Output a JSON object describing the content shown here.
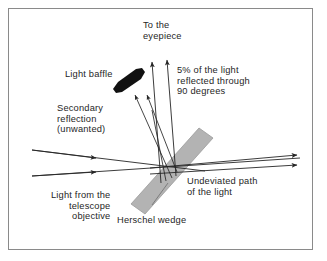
{
  "figure": {
    "kind": "optics-ray-diagram",
    "subject": "Herschel wedge",
    "background_color": "#ffffff",
    "frame_color": "#8a8a8a",
    "ink_color": "#262626",
    "wedge_fill_color": "#b3b3b3",
    "wedge_stroke_color": "#8f8f8f",
    "baffle_color": "#111111"
  },
  "labels": {
    "to_eyepiece": {
      "line1": "To the",
      "line2": "eyepiece"
    },
    "five_percent": {
      "line1": "5% of the light",
      "line2": "reflected through",
      "line3": "90 degrees"
    },
    "light_baffle": "Light baffle",
    "secondary_reflection": {
      "line1": "Secondary",
      "line2": "reflection",
      "line3": "(unwanted)"
    },
    "light_from_objective": {
      "line1": "Light from the",
      "line2": "telescope",
      "line3": "objective"
    },
    "herschel_wedge": "Herschel wedge",
    "undeviated_path": {
      "line1": "Undeviated path",
      "line2": "of the light"
    }
  },
  "elements": {
    "baffle_name": "light-baffle-shape",
    "wedge_name": "herschel-wedge-prism",
    "incoming_rays_name": "incoming-light-rays",
    "transmitted_rays_name": "transmitted-light-rays",
    "eyepiece_rays_name": "reflected-rays-to-eyepiece",
    "secondary_rays_name": "secondary-reflection-rays",
    "leader_name": "herschel-wedge-leader-line"
  }
}
